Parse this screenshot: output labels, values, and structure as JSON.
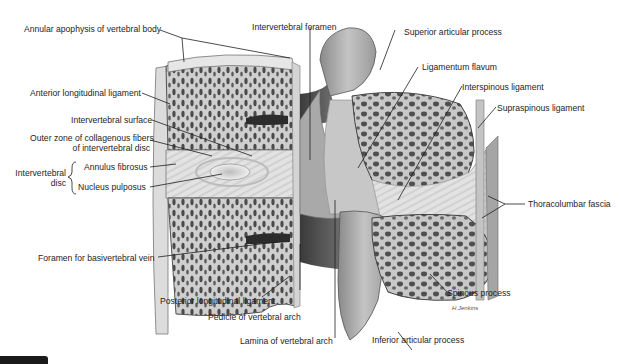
{
  "figure": {
    "type": "anatomical-illustration",
    "colors": {
      "background": "#ffffff",
      "ink": "#1e1e1e",
      "bone_light": "#d9d9d9",
      "bone_dark": "#5a5a5a",
      "tab": "#1a1a1a"
    }
  },
  "labels": {
    "annular_apophysis": "Annular apophysis of vertebral body",
    "intervertebral_foramen": "Intervertebral foramen",
    "superior_articular_process": "Superior articular process",
    "ligamentum_flavum": "Ligamentum flavum",
    "interspinous_ligament": "Interspinous ligament",
    "supraspinous_ligament": "Supraspinous ligament",
    "anterior_longitudinal_ligament": "Anterior longitudinal ligament",
    "intervertebral_surface": "Intervertebral surface",
    "outer_zone_line1": "Outer zone of collagenous fibers",
    "outer_zone_line2": "of intervertebral disc",
    "intervertebral_disc_line1": "Intervertebral",
    "intervertebral_disc_line2": "disc",
    "annulus_fibrosus": "Annulus fibrosus",
    "nucleus_pulposus": "Nucleus pulposus",
    "thoracolumbar_fascia": "Thoracolumbar fascia",
    "foramen_basivertebral_vein": "Foramen for basivertebral vein",
    "posterior_longitudinal_ligament": "Posterior longitudinal ligament",
    "pedicle_vertebral_arch": "Pedicle of vertebral arch",
    "spinous_process": "Spinous process",
    "lamina_vertebral_arch": "Lamina of vertebral arch",
    "inferior_articular_process": "Inferior articular process"
  }
}
